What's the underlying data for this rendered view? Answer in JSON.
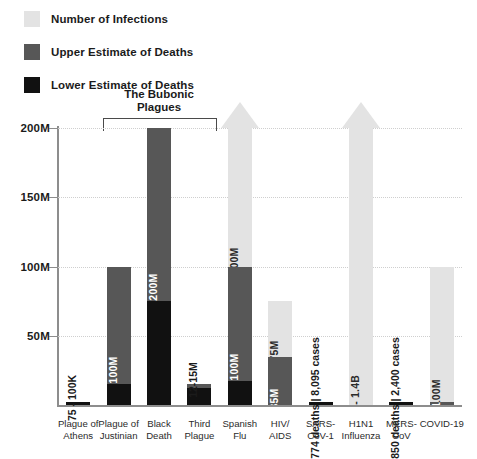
{
  "legend": {
    "items": [
      {
        "label": "Number of Infections",
        "color": "#e3e3e3",
        "key": "infections"
      },
      {
        "label": "Upper Estimate of Deaths",
        "color": "#575757",
        "key": "upper"
      },
      {
        "label": "Lower Estimate of Deaths",
        "color": "#111111",
        "key": "lower"
      }
    ]
  },
  "annotations": {
    "group_bracket_title_line1": "The Bubonic",
    "group_bracket_title_line2": "Plagues"
  },
  "chart_data": {
    "type": "bar",
    "title": "",
    "xlabel": "",
    "ylabel": "",
    "ylim": [
      0,
      200
    ],
    "yunit": "M",
    "grid": true,
    "legend_position": "top-left",
    "yticks": [
      {
        "value": 200,
        "label": "200M"
      },
      {
        "value": 150,
        "label": "150M"
      },
      {
        "value": 100,
        "label": "100M"
      },
      {
        "value": 50,
        "label": "50M"
      }
    ],
    "categories": [
      "Plague of Athens",
      "Plague of Justinian",
      "Black Death",
      "Third Plague",
      "Spanish Flu",
      "HIV/AIDS",
      "SARS-CoV-1",
      "H1N1 Influenza",
      "MERS-CoV",
      "COVID-19"
    ],
    "bars": [
      {
        "name": "Plague of Athens",
        "x_label_line1": "Plague of",
        "x_label_line2": "Athens",
        "infections": 0,
        "upper": 0.1,
        "lower": 0.075,
        "value_label": "75 - 100K",
        "label_placement": "outside",
        "arrow": false
      },
      {
        "name": "Plague of Justinian",
        "x_label_line1": "Plague of",
        "x_label_line2": "Justinian",
        "infections": 0,
        "upper": 100,
        "lower": 15,
        "value_label": "15-100M",
        "label_placement": "upper",
        "arrow": false
      },
      {
        "name": "Black Death",
        "x_label_line1": "Black",
        "x_label_line2": "Death",
        "infections": 0,
        "upper": 200,
        "lower": 75,
        "value_label": "75-200M",
        "label_placement": "upper",
        "arrow": false
      },
      {
        "name": "Third Plague",
        "x_label_line1": "Third",
        "x_label_line2": "Plague",
        "infections": 0,
        "upper": 15,
        "lower": 12,
        "value_label": "12-15M",
        "label_placement": "outside",
        "arrow": false
      },
      {
        "name": "Spanish Flu",
        "x_label_line1": "Spanish",
        "x_label_line2": "Flu",
        "infections": 500,
        "upper": 100,
        "lower": 17,
        "value_label": "17-100M",
        "infections_label": "500M",
        "label_placement": "upper",
        "arrow": true
      },
      {
        "name": "HIV/AIDS",
        "x_label_line1": "HIV/",
        "x_label_line2": "AIDS",
        "infections": 75,
        "upper": 35,
        "lower": 0,
        "value_label": "35M",
        "infections_label": "75M",
        "label_placement": "upper",
        "arrow": false
      },
      {
        "name": "SARS-CoV-1",
        "x_label_line1": "SARS-",
        "x_label_line2": "CoV-1",
        "infections": 0.008095,
        "upper": 0.000774,
        "lower": 0,
        "value_label": "774 deaths | 8,095 cases",
        "label_placement": "outside",
        "arrow": false
      },
      {
        "name": "H1N1 Influenza",
        "x_label_line1": "H1N1",
        "x_label_line2": "Influenza",
        "infections": 1400,
        "upper": 0.284,
        "lower": 0,
        "value_label": "284K deaths",
        "infections_label": "0.7 - 1.4B",
        "label_placement": "outside",
        "arrow": true
      },
      {
        "name": "MERS-CoV",
        "x_label_line1": "MERS-",
        "x_label_line2": "CoV",
        "infections": 0.0024,
        "upper": 0.00085,
        "lower": 0,
        "value_label": "850 deaths | 2,400 cases",
        "label_placement": "outside",
        "arrow": false
      },
      {
        "name": "COVID-19",
        "x_label_line1": "COVID-19",
        "x_label_line2": "",
        "infections": 100,
        "upper": 2.145,
        "lower": 0,
        "value_label": "2.145M",
        "infections_label": "~100M",
        "label_placement": "upper",
        "arrow": false
      }
    ]
  }
}
